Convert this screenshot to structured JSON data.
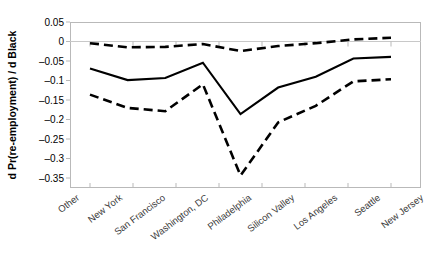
{
  "chart_data": {
    "type": "line",
    "title": "",
    "subtitle": "",
    "xlabel": "",
    "ylabel": "d Pr(re-employment) / d Black",
    "categories": [
      "Other",
      "New York",
      "San Francisco",
      "Washington, DC",
      "Philadelphia",
      "Silicon Valley",
      "Los Angeles",
      "Seattle",
      "New Jersey"
    ],
    "ylim": [
      -0.35,
      0.05
    ],
    "yticks": [
      0.05,
      0,
      -0.05,
      -0.1,
      -0.15,
      -0.2,
      -0.25,
      -0.3,
      -0.35
    ],
    "ytick_labels": [
      "0.05",
      "0",
      "–0.05",
      "–0.1",
      "–0.15",
      "–0.2",
      "–0.25",
      "–0.3",
      "–0.35"
    ],
    "grid": false,
    "zero_reference_line": true,
    "legend": "none",
    "series": [
      {
        "name": "upper-confidence-bound",
        "style": "dashed",
        "values": [
          -0.001,
          -0.011,
          -0.01,
          -0.003,
          -0.02,
          -0.008,
          -0.001,
          0.008,
          0.012
        ]
      },
      {
        "name": "point-estimate",
        "style": "solid",
        "values": [
          -0.062,
          -0.09,
          -0.085,
          -0.048,
          -0.172,
          -0.108,
          -0.082,
          -0.038,
          -0.034
        ]
      },
      {
        "name": "lower-confidence-bound",
        "style": "dashed",
        "values": [
          -0.125,
          -0.157,
          -0.165,
          -0.1,
          -0.32,
          -0.192,
          -0.152,
          -0.093,
          -0.088
        ]
      }
    ]
  },
  "axis": {
    "y_axis_title": "d Pr(re-employment) / d Black"
  }
}
